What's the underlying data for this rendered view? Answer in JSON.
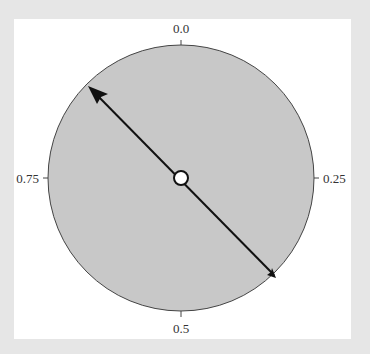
{
  "diagram": {
    "type": "circular-dial",
    "labels": {
      "top": "0.0",
      "right": "0.25",
      "bottom": "0.5",
      "left": "0.75"
    },
    "pointer": {
      "value": 0.875,
      "description": "Double-headed axis through the center, long arrowhead pointing toward upper-left (~0.875), small arrowhead at lower-right (~0.375)"
    },
    "colors": {
      "background": "#e6e6e6",
      "panel": "#ffffff",
      "dial_fill": "#c8c8c8",
      "dial_stroke": "#444444",
      "arrow": "#111111",
      "center_fill": "#ffffff"
    }
  }
}
